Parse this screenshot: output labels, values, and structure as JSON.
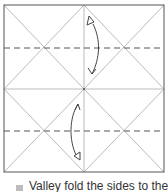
{
  "diagram": {
    "paper": {
      "x": 4,
      "y": 5,
      "width": 160,
      "height": 167
    },
    "colors": {
      "border": "#555555",
      "crease": "#bbbbbb",
      "valley_fold": "#555555",
      "arrow": "#444444",
      "bullet": "#bdbdbd",
      "text": "#333333"
    },
    "valley_folds": [
      {
        "y": 48
      },
      {
        "y": 131
      }
    ],
    "arrows": [
      {
        "name": "top-fold-arrow",
        "from": "bottom",
        "to": "top"
      },
      {
        "name": "bottom-fold-arrow",
        "from": "top",
        "to": "bottom"
      }
    ]
  },
  "caption": {
    "text": "Valley fold the sides to the"
  }
}
